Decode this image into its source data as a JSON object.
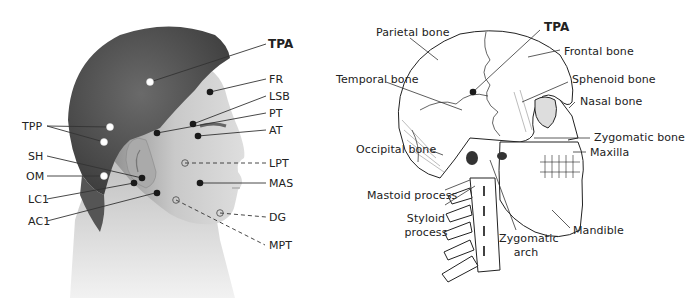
{
  "left_panel": {
    "title": "Head photo with trigger point markers",
    "labels": {
      "tpa": "TPA",
      "fr": "FR",
      "lsb": "LSB",
      "pt": "PT",
      "at": "AT",
      "tpp": "TPP",
      "sh": "SH",
      "om": "OM",
      "lpt": "LPT",
      "mas": "MAS",
      "lc1": "LC1",
      "ac1": "AC1",
      "dg": "DG",
      "mpt": "MPT"
    }
  },
  "right_panel": {
    "title": "Skull and cervical spine anatomy",
    "labels": {
      "parietal": "Parietal bone",
      "tpa": "TPA",
      "frontal": "Frontal bone",
      "temporal": "Temporal bone",
      "sphenoid": "Sphenoid bone",
      "nasal": "Nasal bone",
      "zygomatic_bone": "Zygomatic bone",
      "occipital": "Occipital bone",
      "maxilla": "Maxilla",
      "mastoid": "Mastoid process",
      "styloid_1": "Styloid",
      "styloid_2": "process",
      "zygomatic_arch_1": "Zygomatic",
      "zygomatic_arch_2": "arch",
      "mandible": "Mandible"
    }
  },
  "colors": {
    "marker_dark": "#1a1a1a",
    "marker_light": "#ffffff",
    "hair": "#4a4a4a",
    "skin": "#cfcfcf",
    "line": "#333333"
  }
}
